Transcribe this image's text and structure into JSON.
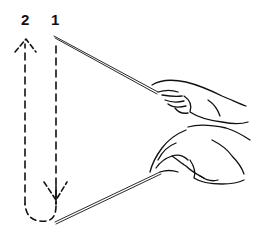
{
  "illustration": {
    "subject": "conducting baton two-beat pattern",
    "beat_labels": [
      "2",
      "1"
    ],
    "colors": {
      "ink": "#111111",
      "background": "#ffffff"
    },
    "paths": [
      {
        "name": "beat-1-downstroke",
        "style": "dashed",
        "direction": "down"
      },
      {
        "name": "beat-2-upstroke",
        "style": "dashed",
        "direction": "up"
      }
    ],
    "batons": [
      {
        "name": "upper-baton-hand",
        "position": "start of beat 1"
      },
      {
        "name": "lower-baton-hand",
        "position": "bottom of beat 1"
      }
    ]
  }
}
